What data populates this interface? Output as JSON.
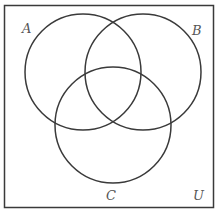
{
  "diagram": {
    "type": "venn",
    "sets": [
      {
        "label": "A",
        "cx": 83,
        "cy": 72,
        "r": 58,
        "label_x": 22,
        "label_y": 33
      },
      {
        "label": "B",
        "cx": 143,
        "cy": 72,
        "r": 58,
        "label_x": 192,
        "label_y": 35
      },
      {
        "label": "C",
        "cx": 113,
        "cy": 125,
        "r": 58,
        "label_x": 106,
        "label_y": 200
      }
    ],
    "universe": {
      "label": "U",
      "label_x": 193,
      "label_y": 200
    },
    "stroke_color": "#3a3a3a",
    "label_color": "#555555"
  }
}
